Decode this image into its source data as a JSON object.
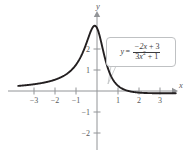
{
  "figure": {
    "title": "",
    "equation": {
      "lhs": "y",
      "equals": "=",
      "numerator": "−2x + 3",
      "denominator_base": "3x",
      "denominator_exp": "2",
      "denominator_tail": " + 1",
      "plain": "y = (−2x + 3) / (3x² + 1)"
    },
    "axis_labels": {
      "x": "x",
      "y": "y"
    }
  },
  "chart_data": {
    "type": "line",
    "title": "",
    "xlabel": "x",
    "ylabel": "y",
    "equation": "y = (-2x + 3)/(3x^2 + 1)",
    "xlim": [
      -3.75,
      3.75
    ],
    "ylim": [
      -2.6,
      3.6
    ],
    "grid": false,
    "legend": null,
    "annotations": [
      {
        "text": "y = (−2x + 3)/(3x² + 1)",
        "type": "callout",
        "points_to": [
          1.3,
          0.05
        ]
      }
    ],
    "xticks": [
      -3,
      -2,
      -1,
      1,
      2,
      3
    ],
    "xticklabels": [
      "−3",
      "−2",
      "−1",
      "1",
      "2",
      "3"
    ],
    "yticks": [
      -2,
      -1,
      1,
      2
    ],
    "yticklabels": [
      "−2",
      "−1",
      "1",
      "2"
    ],
    "series": [
      {
        "name": "y = (-2x + 3)/(3x^2 + 1)",
        "color": "#231f20",
        "x": [
          -3.7,
          -3.5,
          -3.25,
          -3.0,
          -2.75,
          -2.5,
          -2.25,
          -2.0,
          -1.75,
          -1.5,
          -1.25,
          -1.0,
          -0.9,
          -0.8,
          -0.7,
          -0.6,
          -0.5,
          -0.4,
          -0.35,
          -0.3,
          -0.25,
          -0.2,
          -0.1,
          0.0,
          0.1,
          0.2,
          0.3,
          0.4,
          0.5,
          0.6,
          0.75,
          0.9,
          1.0,
          1.2,
          1.5,
          1.75,
          2.0,
          2.25,
          2.5,
          2.75,
          3.0,
          3.25,
          3.5,
          3.7
        ],
        "y": [
          0.25,
          0.27,
          0.29,
          0.32,
          0.35,
          0.39,
          0.44,
          0.5,
          0.57,
          0.67,
          0.8,
          1.25,
          1.41,
          1.61,
          1.83,
          2.08,
          2.35,
          2.61,
          2.72,
          2.8,
          2.85,
          2.85,
          2.68,
          3.0,
          2.61,
          1.84,
          1.39,
          1.05,
          0.8,
          0.61,
          0.35,
          0.15,
          0.25,
          0.14,
          0.0,
          -0.05,
          -0.08,
          -0.09,
          -0.08,
          -0.07,
          -0.07,
          -0.06,
          -0.05,
          -0.05
        ]
      }
    ]
  }
}
